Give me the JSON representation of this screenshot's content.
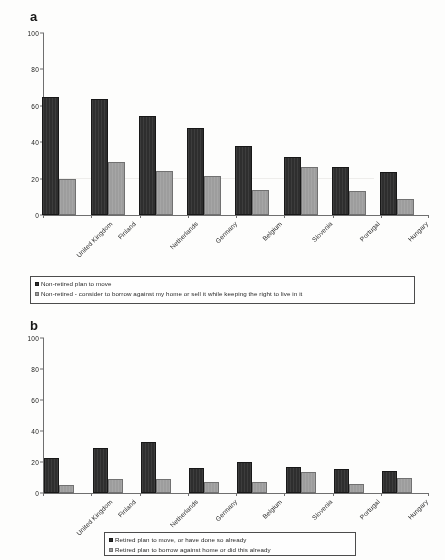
{
  "figure": {
    "panels": [
      {
        "letter": "a",
        "legend": [
          {
            "marker": "dark-square-swatch",
            "label": "Non-retired plan to move"
          },
          {
            "marker": "light-square-swatch",
            "label": "Non-retired - consider to borrow against my home or sell it while keeping the right to live in it"
          }
        ]
      },
      {
        "letter": "b",
        "legend": [
          {
            "marker": "dark-square-swatch",
            "label": "Retired plan to move, or have done so already"
          },
          {
            "marker": "light-square-swatch",
            "label": "Retired plan to borrow against home or did this already"
          }
        ]
      }
    ]
  },
  "colors": {
    "series_dark": "#2b2b2b",
    "series_light": "#9c9c9c",
    "axis": "#6d6d6d",
    "text": "#1d1d1d",
    "background": "#fdfdfc"
  },
  "chart_data": [
    {
      "type": "bar",
      "title": "a",
      "xlabel": "",
      "ylabel": "",
      "ylim": [
        0,
        100
      ],
      "yticks": [
        0,
        20,
        40,
        60,
        80,
        100
      ],
      "ytick_labels": [
        "0",
        "20",
        "40",
        "60",
        "80",
        "100"
      ],
      "grid": false,
      "legend_position": "below",
      "categories": [
        "United Kingdom",
        "Finland",
        "Netherlands",
        "Germany",
        "Belgium",
        "Slovenia",
        "Portugal",
        "Hungary"
      ],
      "series": [
        {
          "name": "Non-retired plan to move",
          "color": "#2b2b2b",
          "values": [
            65,
            64,
            54.5,
            48,
            38,
            32,
            26.5,
            23.5
          ]
        },
        {
          "name": "Non-retired - consider to borrow against my home or sell it while keeping the right to live in it",
          "color": "#9c9c9c",
          "values": [
            20,
            29,
            24,
            21.5,
            14,
            26.5,
            13,
            9
          ]
        }
      ]
    },
    {
      "type": "bar",
      "title": "b",
      "xlabel": "",
      "ylabel": "",
      "ylim": [
        0,
        100
      ],
      "yticks": [
        0,
        20,
        40,
        60,
        80,
        100
      ],
      "ytick_labels": [
        "0",
        "20",
        "40",
        "60",
        "80",
        "100"
      ],
      "grid": false,
      "legend_position": "below",
      "categories": [
        "United Kingdom",
        "Finland",
        "Netherlands",
        "Germany",
        "Belgium",
        "Slovenia",
        "Portugal",
        "Hungary"
      ],
      "series": [
        {
          "name": "Retired plan to move, or have done so already",
          "color": "#2b2b2b",
          "values": [
            22.5,
            29,
            33,
            16,
            20,
            17,
            15.5,
            14
          ]
        },
        {
          "name": "Retired plan to borrow against home or did this already",
          "color": "#9c9c9c",
          "values": [
            5,
            9,
            9,
            7,
            7,
            13.5,
            5.5,
            9.5
          ]
        }
      ]
    }
  ]
}
